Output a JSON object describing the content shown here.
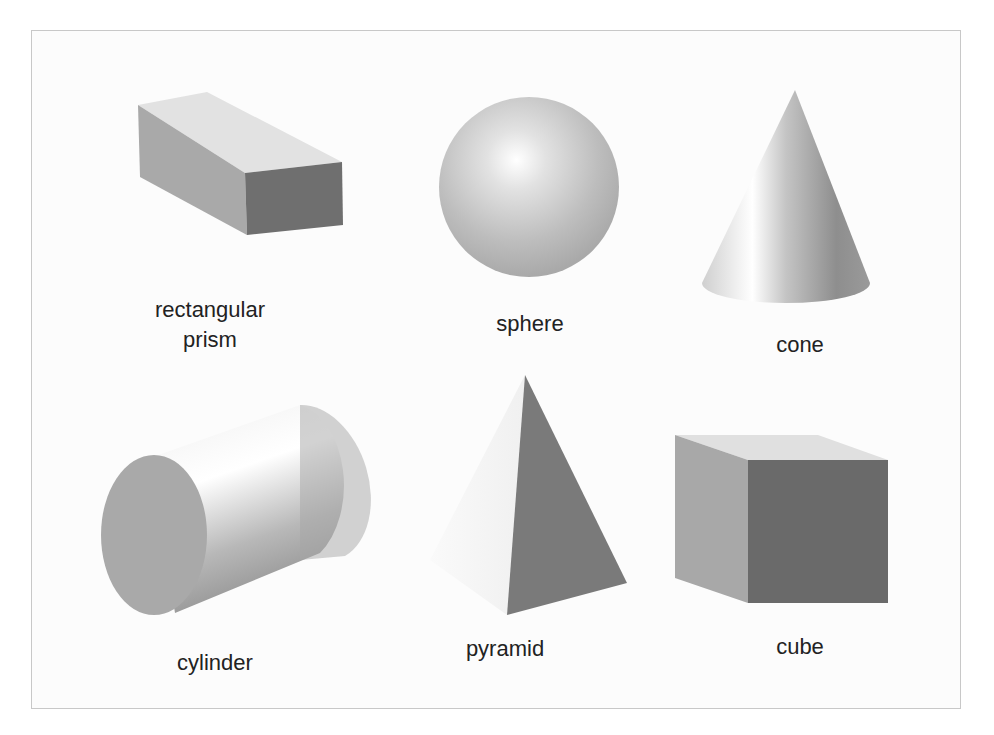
{
  "figure": {
    "background": "#ffffff",
    "frame_border_color": "#c8c8c8",
    "shapes": [
      {
        "id": "rectangular-prism",
        "label_lines": [
          "rectangular",
          "prism"
        ]
      },
      {
        "id": "sphere",
        "label_lines": [
          "sphere"
        ]
      },
      {
        "id": "cone",
        "label_lines": [
          "cone"
        ]
      },
      {
        "id": "cylinder",
        "label_lines": [
          "cylinder"
        ]
      },
      {
        "id": "pyramid",
        "label_lines": [
          "pyramid"
        ]
      },
      {
        "id": "cube",
        "label_lines": [
          "cube"
        ]
      }
    ],
    "colors": {
      "light_face": "#e4e4e4",
      "mid_face": "#a8a8a8",
      "dark_face": "#6e6e6e",
      "label_text": "#222222"
    }
  }
}
